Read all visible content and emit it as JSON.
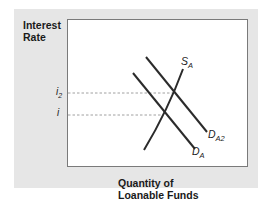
{
  "diagram": {
    "type": "supply-demand",
    "title": "",
    "y_axis_label_line1": "Interest",
    "y_axis_label_line2": "Rate",
    "x_axis_label_line1": "Quantity of",
    "x_axis_label_line2": "Loanable Funds",
    "y_ticks": [
      {
        "base": "i",
        "sub": "2"
      },
      {
        "base": "i",
        "sub": ""
      }
    ],
    "curves": [
      {
        "name": "supply",
        "base": "S",
        "sub": "A"
      },
      {
        "name": "demand-shifted",
        "base": "D",
        "sub": "A2"
      },
      {
        "name": "demand",
        "base": "D",
        "sub": "A"
      }
    ],
    "colors": {
      "panel": "#e6e6e6",
      "plot": "#ffffff",
      "line": "#2b2b2b",
      "dashed": "#888888"
    }
  }
}
